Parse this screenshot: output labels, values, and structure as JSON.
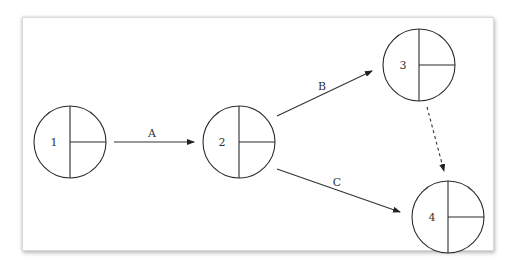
{
  "diagram": {
    "type": "activity-on-arrow network",
    "nodes": [
      {
        "id": "1",
        "label": "1",
        "cx": 70,
        "cy": 142,
        "r": 36
      },
      {
        "id": "2",
        "label": "2",
        "cx": 239,
        "cy": 142,
        "r": 36
      },
      {
        "id": "3",
        "label": "3",
        "cx": 419,
        "cy": 65,
        "r": 36
      },
      {
        "id": "4",
        "label": "4",
        "cx": 448,
        "cy": 217,
        "r": 36
      }
    ],
    "edges": [
      {
        "from": "1",
        "to": "2",
        "label": "A",
        "style": "solid"
      },
      {
        "from": "2",
        "to": "3",
        "label": "B",
        "style": "solid"
      },
      {
        "from": "2",
        "to": "4",
        "label": "C",
        "style": "solid"
      },
      {
        "from": "3",
        "to": "4",
        "label": "",
        "style": "dashed"
      }
    ]
  }
}
